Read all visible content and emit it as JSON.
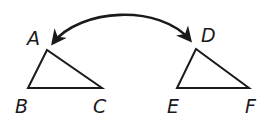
{
  "diagram": {
    "stroke_color": "#1a1a1a",
    "background": "#ffffff",
    "triangles": [
      {
        "name": "ABC",
        "vertices": [
          {
            "label": "A",
            "x": 47,
            "y": 50
          },
          {
            "label": "B",
            "x": 28,
            "y": 88
          },
          {
            "label": "C",
            "x": 102,
            "y": 88
          }
        ]
      },
      {
        "name": "DEF",
        "vertices": [
          {
            "label": "D",
            "x": 196,
            "y": 49
          },
          {
            "label": "E",
            "x": 177,
            "y": 88
          },
          {
            "label": "F",
            "x": 249,
            "y": 88
          }
        ]
      }
    ],
    "labels": {
      "A": "A",
      "B": "B",
      "C": "C",
      "D": "D",
      "E": "E",
      "F": "F"
    },
    "arrow": {
      "type": "double-headed-curved",
      "from": "A",
      "to": "D"
    }
  }
}
